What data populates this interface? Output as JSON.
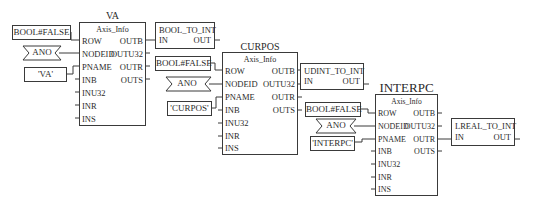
{
  "diagram": {
    "kind": "PLC function block diagram",
    "blocks": [
      {
        "instance": "VA",
        "type": "Axis_Info",
        "inputs": [
          "ROW",
          "NODEID",
          "PNAME",
          "INB",
          "INU32",
          "INR",
          "INS"
        ],
        "outputs": [
          "OUTB",
          "OUTU32",
          "OUTR",
          "OUTS"
        ],
        "const_row": "BOOL#FALSE",
        "const_nodeid": "ANO",
        "const_pname": "'VA'"
      },
      {
        "instance": "CURPOS",
        "type": "Axis_Info",
        "inputs": [
          "ROW",
          "NODEID",
          "PNAME",
          "INB",
          "INU32",
          "INR",
          "INS"
        ],
        "outputs": [
          "OUTB",
          "OUTU32",
          "OUTR",
          "OUTS"
        ],
        "const_row": "BOOL#FALSE",
        "const_nodeid": "ANO",
        "const_pname": "'CURPOS'"
      },
      {
        "instance": "INTERPC",
        "type": "Axis_Info",
        "inputs": [
          "ROW",
          "NODEID",
          "PNAME",
          "INB",
          "INU32",
          "INR",
          "INS"
        ],
        "outputs": [
          "OUTB",
          "OUTU32",
          "OUTR",
          "OUTS"
        ],
        "const_row": "BOOL#FALSE",
        "const_nodeid": "ANO",
        "const_pname": "'INTERPC'"
      }
    ],
    "converters": [
      {
        "type": "BOOL_TO_INT",
        "input": "IN",
        "output": "OUT",
        "source": "VA.OUTB"
      },
      {
        "type": "UDINT_TO_INT",
        "input": "IN",
        "output": "OUT",
        "source": "CURPOS.OUTU32"
      },
      {
        "type": "LREAL_TO_INT",
        "input": "IN",
        "output": "OUT",
        "source": "INTERPC.OUTR"
      }
    ]
  }
}
